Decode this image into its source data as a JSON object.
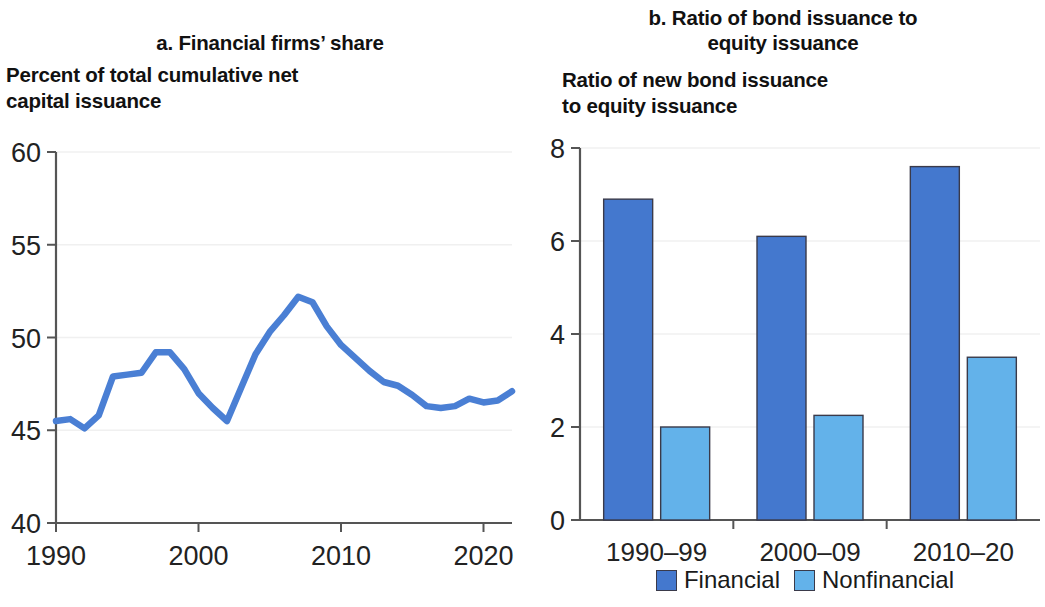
{
  "figure": {
    "panel_a": {
      "panel_title": "a. Financial firms’ share",
      "axis_title_line1": "Percent of total cumulative net",
      "axis_title_line2": "capital issuance"
    },
    "panel_b": {
      "panel_title_line1": "b. Ratio of bond issuance to",
      "panel_title_line2": "equity issuance",
      "axis_title_line1": "Ratio of new bond issuance",
      "axis_title_line2": "to equity issuance",
      "legend": [
        {
          "label": "Financial",
          "color": "#4478ce"
        },
        {
          "label": "Nonfinancial",
          "color": "#63b2ea"
        }
      ]
    }
  },
  "chart_data": [
    {
      "type": "line",
      "title": "a. Financial firms’ share",
      "ylabel": "Percent of total cumulative net capital issuance",
      "xlabel": "",
      "ylim": [
        40,
        60
      ],
      "xlim": [
        1990,
        2022
      ],
      "yticks": [
        40,
        45,
        50,
        55,
        60
      ],
      "xticks": [
        1990,
        2000,
        2010,
        2020
      ],
      "grid": true,
      "line_color": "#4a7fd4",
      "series": [
        {
          "name": "Financial firms’ share",
          "x": [
            1990,
            1991,
            1992,
            1993,
            1994,
            1995,
            1996,
            1997,
            1998,
            1999,
            2000,
            2001,
            2002,
            2003,
            2004,
            2005,
            2006,
            2007,
            2008,
            2009,
            2010,
            2011,
            2012,
            2013,
            2014,
            2015,
            2016,
            2017,
            2018,
            2019,
            2020,
            2021,
            2022
          ],
          "values": [
            45.5,
            45.6,
            45.1,
            45.8,
            47.9,
            48.0,
            48.1,
            49.2,
            49.2,
            48.3,
            47.0,
            46.2,
            45.5,
            47.3,
            49.1,
            50.3,
            51.2,
            52.2,
            51.9,
            50.6,
            49.6,
            48.9,
            48.2,
            47.6,
            47.4,
            46.9,
            46.3,
            46.2,
            46.3,
            46.7,
            46.5,
            46.6,
            47.1
          ]
        }
      ]
    },
    {
      "type": "bar",
      "title": "b. Ratio of bond issuance to equity issuance",
      "ylabel": "Ratio of new bond issuance to equity issuance",
      "xlabel": "",
      "ylim": [
        0,
        8
      ],
      "yticks": [
        0,
        2,
        4,
        6,
        8
      ],
      "grid": true,
      "categories": [
        "1990–99",
        "2000–09",
        "2010–20"
      ],
      "legend_position": "bottom",
      "series": [
        {
          "name": "Financial",
          "color": "#4478ce",
          "values": [
            6.9,
            6.1,
            7.6
          ]
        },
        {
          "name": "Nonfinancial",
          "color": "#63b2ea",
          "values": [
            2.0,
            2.25,
            3.5
          ]
        }
      ]
    }
  ]
}
